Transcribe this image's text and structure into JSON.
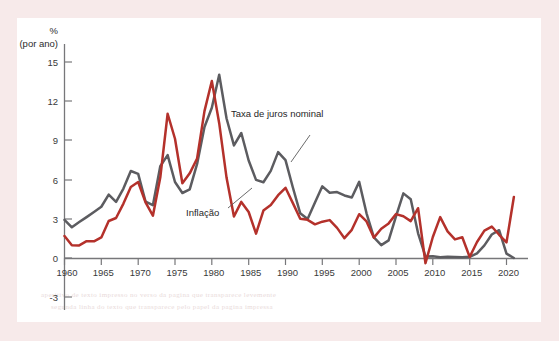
{
  "figure": {
    "background_color": "#f7eaea",
    "plate_color": "#ffffff",
    "axis_color": "#77777a"
  },
  "axis": {
    "unit_label_line1": "%",
    "unit_label_line2": "(por ano)",
    "y_ticks": [
      "15",
      "12",
      "9",
      "6",
      "3",
      "0",
      "-3"
    ],
    "x_ticks": [
      "1960",
      "1965",
      "1970",
      "1975",
      "1980",
      "1985",
      "1990",
      "1995",
      "2000",
      "2005",
      "2010",
      "2015",
      "2020"
    ]
  },
  "annotations": {
    "nominal_rate_label": "Taxa de juros nominal",
    "inflation_label": "Inflação"
  },
  "ghost_text": {
    "line1": "aperitivo de texto impresso no verso da pagina que transparece levemente",
    "line2": "segunda linha do texto que transparece pelo papel da pagina impressa"
  },
  "chart_data": {
    "type": "line",
    "title": "",
    "xlabel": "",
    "ylabel": "% (por ano)",
    "xlim": [
      1960,
      2022
    ],
    "ylim": [
      -3,
      16
    ],
    "yticks": [
      -3,
      0,
      3,
      6,
      9,
      12,
      15
    ],
    "xticks": [
      1960,
      1965,
      1970,
      1975,
      1980,
      1985,
      1990,
      1995,
      2000,
      2005,
      2010,
      2015,
      2020
    ],
    "grid": false,
    "legend_position": "inline-annotations",
    "x": [
      1960,
      1961,
      1962,
      1963,
      1964,
      1965,
      1966,
      1967,
      1968,
      1969,
      1970,
      1971,
      1972,
      1973,
      1974,
      1975,
      1976,
      1977,
      1978,
      1979,
      1980,
      1981,
      1982,
      1983,
      1984,
      1985,
      1986,
      1987,
      1988,
      1989,
      1990,
      1991,
      1992,
      1993,
      1994,
      1995,
      1996,
      1997,
      1998,
      1999,
      2000,
      2001,
      2002,
      2003,
      2004,
      2005,
      2006,
      2007,
      2008,
      2009,
      2010,
      2011,
      2012,
      2013,
      2014,
      2015,
      2016,
      2017,
      2018,
      2019,
      2020,
      2021
    ],
    "series": [
      {
        "name": "Taxa de juros nominal",
        "color": "#5c5c60",
        "values": [
          2.95,
          2.38,
          2.78,
          3.16,
          3.55,
          3.95,
          4.88,
          4.32,
          5.34,
          6.68,
          6.46,
          4.35,
          4.07,
          7.04,
          7.89,
          5.84,
          5.0,
          5.27,
          7.22,
          10.04,
          11.51,
          14.03,
          10.69,
          8.63,
          9.58,
          7.48,
          6.0,
          5.82,
          6.69,
          8.12,
          7.51,
          5.42,
          3.45,
          3.02,
          4.27,
          5.51,
          5.02,
          5.07,
          4.81,
          4.66,
          5.85,
          3.45,
          1.62,
          1.02,
          1.38,
          3.22,
          4.97,
          4.52,
          1.92,
          0.16,
          0.18,
          0.1,
          0.14,
          0.11,
          0.09,
          0.13,
          0.39,
          1.0,
          1.83,
          2.16,
          0.37,
          0.04
        ]
      },
      {
        "name": "Inflação",
        "color": "#b4312b",
        "values": [
          1.72,
          1.01,
          1.0,
          1.32,
          1.31,
          1.61,
          2.86,
          3.09,
          4.19,
          5.46,
          5.84,
          4.29,
          3.27,
          6.18,
          11.05,
          9.14,
          5.74,
          6.5,
          7.63,
          11.25,
          13.55,
          10.33,
          6.16,
          3.21,
          4.32,
          3.55,
          1.9,
          3.66,
          4.08,
          4.83,
          5.4,
          4.23,
          3.03,
          2.95,
          2.61,
          2.81,
          2.93,
          2.34,
          1.55,
          2.19,
          3.38,
          2.83,
          1.59,
          2.27,
          2.68,
          3.39,
          3.23,
          2.85,
          3.84,
          -0.36,
          1.64,
          3.16,
          2.07,
          1.46,
          1.62,
          0.12,
          1.26,
          2.13,
          2.44,
          1.81,
          1.23,
          4.7
        ]
      }
    ]
  }
}
